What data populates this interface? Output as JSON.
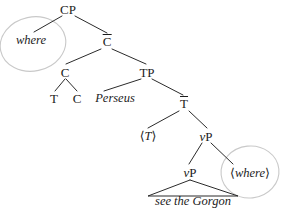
{
  "figure": {
    "kind": "syntax-tree",
    "background_color": "#ffffff",
    "line_color": "#2b2b2b",
    "circle_color": "#c9c9c9",
    "text_color": "#1c1c1c"
  },
  "nodes": {
    "cp": {
      "label": "CP",
      "x": 68,
      "y": 9
    },
    "where_moved": {
      "label": "where",
      "x": 31,
      "y": 40
    },
    "cbar": {
      "label": "C",
      "bar": "̄",
      "x": 107,
      "y": 41
    },
    "c_complex": {
      "label": "C",
      "x": 65,
      "y": 72
    },
    "t_head": {
      "label": "T",
      "x": 54,
      "y": 98
    },
    "c_head": {
      "label": "C",
      "x": 77,
      "y": 98
    },
    "tp": {
      "label": "TP",
      "x": 147,
      "y": 72
    },
    "perseus": {
      "label": "Perseus",
      "x": 115,
      "y": 98
    },
    "tbar": {
      "label": "T",
      "bar": "̄",
      "x": 184,
      "y": 103
    },
    "t_trace": {
      "label": "⟨T⟩",
      "inner": "T",
      "x": 148,
      "y": 136
    },
    "vp_upper": {
      "label": "vP",
      "head": "v",
      "rest": "P",
      "x": 206,
      "y": 136
    },
    "vp_lower": {
      "label": "vP",
      "head": "v",
      "rest": "P",
      "x": 190,
      "y": 172
    },
    "where_trace": {
      "label": "⟨where⟩",
      "inner": "where",
      "x": 250,
      "y": 173
    },
    "vp_phrase": {
      "label": "see the Gorgon",
      "x": 193,
      "y": 201
    }
  },
  "edges": [
    {
      "name": "cp-to-where",
      "from": "cp",
      "to": "where_moved"
    },
    {
      "name": "cp-to-cbar",
      "from": "cp",
      "to": "cbar"
    },
    {
      "name": "cbar-to-c",
      "from": "cbar",
      "to": "c_complex"
    },
    {
      "name": "cbar-to-tp",
      "from": "cbar",
      "to": "tp"
    },
    {
      "name": "c-to-t-head",
      "from": "c_complex",
      "to": "t_head"
    },
    {
      "name": "c-to-c-head",
      "from": "c_complex",
      "to": "c_head"
    },
    {
      "name": "tp-to-perseus",
      "from": "tp",
      "to": "perseus"
    },
    {
      "name": "tp-to-tbar",
      "from": "tp",
      "to": "tbar"
    },
    {
      "name": "tbar-to-t-trace",
      "from": "tbar",
      "to": "t_trace"
    },
    {
      "name": "tbar-to-vp-upper",
      "from": "tbar",
      "to": "vp_upper"
    },
    {
      "name": "vp-upper-to-vp-lower",
      "from": "vp_upper",
      "to": "vp_lower"
    },
    {
      "name": "vp-upper-to-where-trace",
      "from": "vp_upper",
      "to": "where_trace"
    }
  ],
  "triangle": {
    "name": "vp-phrase-triangle",
    "apex_x": 190,
    "apex_y": 180,
    "left_x": 148,
    "left_y": 196,
    "right_x": 238,
    "right_y": 196
  },
  "circles": [
    {
      "name": "where-moved-circle",
      "cx": 33,
      "cy": 44,
      "rx": 33,
      "ry": 27,
      "rotate": -12
    },
    {
      "name": "where-trace-circle",
      "cx": 250,
      "cy": 172,
      "rx": 29,
      "ry": 26,
      "rotate": -6
    }
  ]
}
